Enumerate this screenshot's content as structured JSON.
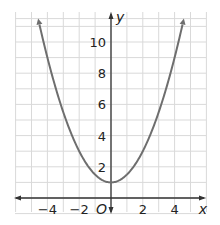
{
  "chart_data": {
    "type": "line",
    "title": "",
    "function": "y = 0.5x^2 + 1",
    "xlabel": "x",
    "ylabel": "y",
    "origin_label": "O",
    "xlim": [
      -6,
      6
    ],
    "ylim": [
      -1,
      11.5
    ],
    "grid": true,
    "x_ticks": [
      -4,
      -2,
      2,
      4
    ],
    "x_tick_labels": [
      "−4",
      "−2",
      "2",
      "4"
    ],
    "y_ticks": [
      2,
      4,
      6,
      8,
      10
    ],
    "y_tick_labels": [
      "2",
      "4",
      "6",
      "8",
      "10"
    ],
    "series": [
      {
        "name": "parabola",
        "x": [
          -4.6,
          -4,
          -3,
          -2,
          -1,
          0,
          1,
          2,
          3,
          4,
          4.6
        ],
        "values": [
          11.58,
          9,
          5.5,
          3,
          1.5,
          1,
          1.5,
          3,
          5.5,
          9,
          11.58
        ]
      }
    ],
    "vertex": [
      0,
      1
    ],
    "colors": {
      "curve": "#6e6e6e",
      "grid": "#d9d9d9",
      "axis": "#333333"
    }
  }
}
